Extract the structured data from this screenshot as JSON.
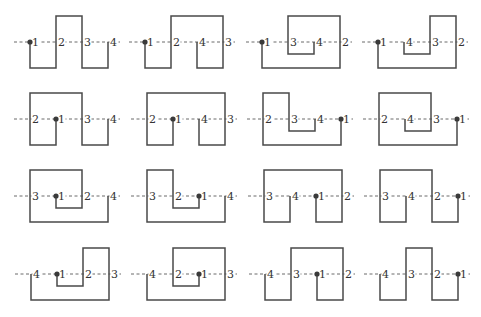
{
  "figure": {
    "unit_spacing": 26,
    "levels": {
      "T": -26,
      "M": 0,
      "I": 12,
      "B": 26
    },
    "colors": {
      "curve": "#4a4a4a",
      "dash": "#6a6a6a",
      "dot": "#3a3a3a",
      "label": "#333333",
      "background": "#ffffff"
    }
  },
  "rows": [
    {
      "y": 42,
      "panels": [
        {
          "x": 30,
          "labels": [
            "1",
            "2",
            "3",
            "4"
          ],
          "dot": 0,
          "path": [
            [
              0,
              "M"
            ],
            [
              0,
              "B"
            ],
            [
              1,
              "B"
            ],
            [
              1,
              "T"
            ],
            [
              2,
              "T"
            ],
            [
              2,
              "B"
            ],
            [
              3,
              "B"
            ],
            [
              3,
              "M"
            ]
          ]
        },
        {
          "x": 145,
          "labels": [
            "1",
            "2",
            "4",
            "3"
          ],
          "dot": 0,
          "path": [
            [
              0,
              "M"
            ],
            [
              0,
              "B"
            ],
            [
              1,
              "B"
            ],
            [
              1,
              "T"
            ],
            [
              3,
              "T"
            ],
            [
              3,
              "B"
            ],
            [
              2,
              "B"
            ],
            [
              2,
              "M"
            ]
          ]
        },
        {
          "x": 262,
          "labels": [
            "1",
            "3",
            "4",
            "2"
          ],
          "dot": 0,
          "path": [
            [
              0,
              "M"
            ],
            [
              0,
              "B"
            ],
            [
              3,
              "B"
            ],
            [
              3,
              "T"
            ],
            [
              1,
              "T"
            ],
            [
              1,
              "I"
            ],
            [
              2,
              "I"
            ],
            [
              2,
              "M"
            ]
          ]
        },
        {
          "x": 378,
          "labels": [
            "1",
            "4",
            "3",
            "2"
          ],
          "dot": 0,
          "path": [
            [
              0,
              "M"
            ],
            [
              0,
              "B"
            ],
            [
              3,
              "B"
            ],
            [
              3,
              "T"
            ],
            [
              2,
              "T"
            ],
            [
              2,
              "I"
            ],
            [
              1,
              "I"
            ],
            [
              1,
              "M"
            ]
          ]
        }
      ]
    },
    {
      "y": 119,
      "panels": [
        {
          "x": 30,
          "labels": [
            "2",
            "1",
            "3",
            "4"
          ],
          "dot": 1,
          "path": [
            [
              1,
              "M"
            ],
            [
              1,
              "B"
            ],
            [
              0,
              "B"
            ],
            [
              0,
              "T"
            ],
            [
              2,
              "T"
            ],
            [
              2,
              "B"
            ],
            [
              3,
              "B"
            ],
            [
              3,
              "M"
            ]
          ]
        },
        {
          "x": 147,
          "labels": [
            "2",
            "1",
            "4",
            "3"
          ],
          "dot": 1,
          "path": [
            [
              1,
              "M"
            ],
            [
              1,
              "B"
            ],
            [
              0,
              "B"
            ],
            [
              0,
              "T"
            ],
            [
              3,
              "T"
            ],
            [
              3,
              "B"
            ],
            [
              2,
              "B"
            ],
            [
              2,
              "M"
            ]
          ]
        },
        {
          "x": 263,
          "labels": [
            "2",
            "3",
            "4",
            "1"
          ],
          "dot": 3,
          "path": [
            [
              3,
              "M"
            ],
            [
              3,
              "B"
            ],
            [
              0,
              "B"
            ],
            [
              0,
              "T"
            ],
            [
              1,
              "T"
            ],
            [
              1,
              "I"
            ],
            [
              2,
              "I"
            ],
            [
              2,
              "M"
            ]
          ]
        },
        {
          "x": 379,
          "labels": [
            "2",
            "4",
            "3",
            "1"
          ],
          "dot": 3,
          "path": [
            [
              3,
              "M"
            ],
            [
              3,
              "B"
            ],
            [
              0,
              "B"
            ],
            [
              0,
              "T"
            ],
            [
              2,
              "T"
            ],
            [
              2,
              "I"
            ],
            [
              1,
              "I"
            ],
            [
              1,
              "M"
            ]
          ]
        }
      ]
    },
    {
      "y": 196,
      "panels": [
        {
          "x": 30,
          "labels": [
            "3",
            "1",
            "2",
            "4"
          ],
          "dot": 1,
          "path": [
            [
              1,
              "M"
            ],
            [
              1,
              "I"
            ],
            [
              2,
              "I"
            ],
            [
              2,
              "T"
            ],
            [
              0,
              "T"
            ],
            [
              0,
              "B"
            ],
            [
              3,
              "B"
            ],
            [
              3,
              "M"
            ]
          ]
        },
        {
          "x": 147,
          "labels": [
            "3",
            "2",
            "1",
            "4"
          ],
          "dot": 2,
          "path": [
            [
              2,
              "M"
            ],
            [
              2,
              "I"
            ],
            [
              1,
              "I"
            ],
            [
              1,
              "T"
            ],
            [
              0,
              "T"
            ],
            [
              0,
              "B"
            ],
            [
              3,
              "B"
            ],
            [
              3,
              "M"
            ]
          ]
        },
        {
          "x": 264,
          "labels": [
            "3",
            "4",
            "1",
            "2"
          ],
          "dot": 2,
          "path": [
            [
              2,
              "M"
            ],
            [
              2,
              "B"
            ],
            [
              3,
              "B"
            ],
            [
              3,
              "T"
            ],
            [
              0,
              "T"
            ],
            [
              0,
              "B"
            ],
            [
              1,
              "B"
            ],
            [
              1,
              "M"
            ]
          ]
        },
        {
          "x": 380,
          "labels": [
            "3",
            "4",
            "2",
            "1"
          ],
          "dot": 3,
          "path": [
            [
              3,
              "M"
            ],
            [
              3,
              "B"
            ],
            [
              2,
              "B"
            ],
            [
              2,
              "T"
            ],
            [
              0,
              "T"
            ],
            [
              0,
              "B"
            ],
            [
              1,
              "B"
            ],
            [
              1,
              "M"
            ]
          ]
        }
      ]
    },
    {
      "y": 274,
      "panels": [
        {
          "x": 31,
          "labels": [
            "4",
            "1",
            "2",
            "3"
          ],
          "dot": 1,
          "path": [
            [
              1,
              "M"
            ],
            [
              1,
              "I"
            ],
            [
              2,
              "I"
            ],
            [
              2,
              "T"
            ],
            [
              3,
              "T"
            ],
            [
              3,
              "B"
            ],
            [
              0,
              "B"
            ],
            [
              0,
              "M"
            ]
          ]
        },
        {
          "x": 147,
          "labels": [
            "4",
            "2",
            "1",
            "3"
          ],
          "dot": 2,
          "path": [
            [
              2,
              "M"
            ],
            [
              2,
              "I"
            ],
            [
              1,
              "I"
            ],
            [
              1,
              "T"
            ],
            [
              3,
              "T"
            ],
            [
              3,
              "B"
            ],
            [
              0,
              "B"
            ],
            [
              0,
              "M"
            ]
          ]
        },
        {
          "x": 265,
          "labels": [
            "4",
            "3",
            "1",
            "2"
          ],
          "dot": 2,
          "path": [
            [
              2,
              "M"
            ],
            [
              2,
              "B"
            ],
            [
              3,
              "B"
            ],
            [
              3,
              "T"
            ],
            [
              1,
              "T"
            ],
            [
              1,
              "B"
            ],
            [
              0,
              "B"
            ],
            [
              0,
              "M"
            ]
          ]
        },
        {
          "x": 380,
          "labels": [
            "4",
            "3",
            "2",
            "1"
          ],
          "dot": 3,
          "path": [
            [
              3,
              "M"
            ],
            [
              3,
              "B"
            ],
            [
              2,
              "B"
            ],
            [
              2,
              "T"
            ],
            [
              1,
              "T"
            ],
            [
              1,
              "B"
            ],
            [
              0,
              "B"
            ],
            [
              0,
              "M"
            ]
          ]
        }
      ]
    }
  ]
}
